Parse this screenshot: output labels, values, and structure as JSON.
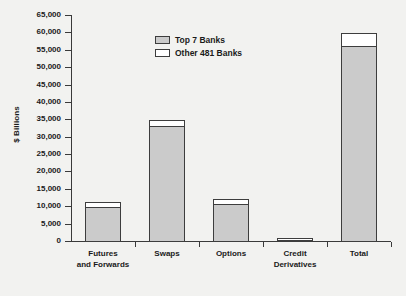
{
  "chart_data": {
    "type": "bar",
    "title": "",
    "subtitle": "",
    "xlabel": "",
    "ylabel": "$ Billions",
    "ylim": [
      0,
      65000
    ],
    "ytick_step": 5000,
    "yticks": [
      "0",
      "5,000",
      "10,000",
      "15,000",
      "20,000",
      "25,000",
      "30,000",
      "35,000",
      "40,000",
      "45,000",
      "50,000",
      "55,000",
      "60,000",
      "65,000"
    ],
    "grid": false,
    "stacked": true,
    "legend_position": "top-left",
    "categories": [
      "Futures\nand Forwards",
      "Swaps",
      "Options",
      "Credit\nDerivatives",
      "Total"
    ],
    "series": [
      {
        "name": "Top 7 Banks",
        "color": "#cbcbcb",
        "values": [
          10000,
          33500,
          11000,
          950,
          56500
        ]
      },
      {
        "name": "Other 481 Banks",
        "color": "#ffffff",
        "values": [
          1500,
          1500,
          1500,
          100,
          3500
        ]
      }
    ],
    "totals": [
      11500,
      35000,
      12500,
      1050,
      60000
    ]
  },
  "legend": {
    "items": [
      {
        "label": "Top 7 Banks",
        "swatch": "gray"
      },
      {
        "label": "Other 481 Banks",
        "swatch": "white"
      }
    ]
  },
  "axis": {
    "y_title": "$ Billions"
  }
}
